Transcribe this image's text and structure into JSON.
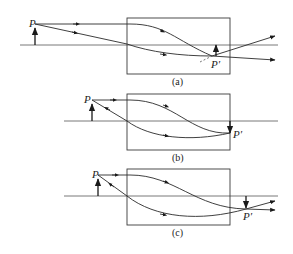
{
  "figure": {
    "panels": [
      {
        "id": "a",
        "caption": "(a)",
        "object_label": "P",
        "image_label": "P′"
      },
      {
        "id": "b",
        "caption": "(b)",
        "object_label": "P",
        "image_label": "P′"
      },
      {
        "id": "c",
        "caption": "(c)",
        "object_label": "P",
        "image_label": "P′"
      }
    ]
  },
  "colors": {
    "line": "#2a2a2a",
    "background": "#ffffff"
  }
}
